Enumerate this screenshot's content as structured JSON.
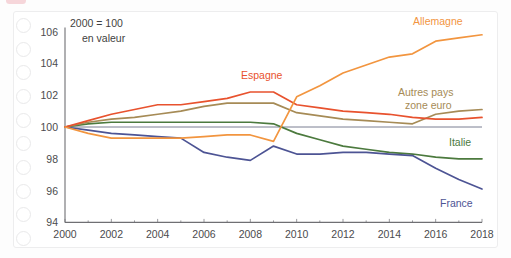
{
  "card": {
    "background_color": "#ffffff",
    "border_color": "#ededee"
  },
  "binding": {
    "name": "notebook-binding-holes",
    "count": 10,
    "color": "#e9e9ea"
  },
  "annotation": {
    "line1": "2000 = 100",
    "line2": "en valeur"
  },
  "axis": {
    "y_ticks": [
      "94",
      "96",
      "98",
      "100",
      "102",
      "104",
      "106"
    ],
    "x_ticks": [
      "2000",
      "2002",
      "2004",
      "2006",
      "2008",
      "2010",
      "2012",
      "2014",
      "2016",
      "2018"
    ],
    "tick_color": "#4b4b4d"
  },
  "labels": {
    "allemagne": "Allemagne",
    "espagne": "Espagne",
    "autres_pays_l1": "Autres pays",
    "autres_pays_l2": "zone euro",
    "italie": "Italie",
    "france": "France"
  },
  "chart_data": {
    "type": "line",
    "title": "",
    "subtitle": "",
    "annotation": "2000 = 100 en valeur",
    "xlabel": "",
    "ylabel": "",
    "xlim": [
      2000,
      2018
    ],
    "ylim": [
      94,
      106
    ],
    "grid": false,
    "legend_position": "inline-right",
    "x": [
      2000,
      2001,
      2002,
      2003,
      2004,
      2005,
      2006,
      2007,
      2008,
      2009,
      2010,
      2011,
      2012,
      2013,
      2014,
      2015,
      2016,
      2017,
      2018
    ],
    "series": [
      {
        "name": "Allemagne",
        "color": "#f59game",
        "values": [
          100.0,
          99.6,
          99.3,
          99.3,
          99.3,
          99.3,
          99.4,
          99.5,
          99.5,
          99.1,
          101.9,
          102.6,
          103.4,
          103.9,
          104.4,
          104.6,
          105.4,
          105.6,
          105.8
        ]
      },
      {
        "name": "Espagne",
        "color": "#e8522e",
        "values": [
          100.0,
          100.4,
          100.8,
          101.1,
          101.4,
          101.4,
          101.6,
          101.8,
          102.2,
          102.2,
          101.4,
          101.2,
          101.0,
          100.9,
          100.8,
          100.6,
          100.5,
          100.5,
          100.6
        ]
      },
      {
        "name": "Autres pays zone euro",
        "color": "#a68b56"
      },
      {
        "name": "Italie",
        "color": "#4c7a3e"
      },
      {
        "name": "France",
        "color": "#4d5494"
      }
    ],
    "series_values": {
      "Allemagne": [
        100.0,
        99.6,
        99.3,
        99.3,
        99.3,
        99.3,
        99.4,
        99.5,
        99.5,
        99.1,
        101.9,
        102.6,
        103.4,
        103.9,
        104.4,
        104.6,
        105.4,
        105.6,
        105.8
      ],
      "Espagne": [
        100.0,
        100.4,
        100.8,
        101.1,
        101.4,
        101.4,
        101.6,
        101.8,
        102.2,
        102.2,
        101.4,
        101.2,
        101.0,
        100.9,
        100.8,
        100.6,
        100.5,
        100.5,
        100.6
      ],
      "Autres pays zone euro": [
        100.0,
        100.3,
        100.5,
        100.6,
        100.8,
        101.0,
        101.3,
        101.5,
        101.5,
        101.5,
        100.9,
        100.7,
        100.5,
        100.4,
        100.3,
        100.2,
        100.8,
        101.0,
        101.1
      ],
      "Italie": [
        100.0,
        100.2,
        100.3,
        100.3,
        100.3,
        100.3,
        100.3,
        100.3,
        100.3,
        100.2,
        99.6,
        99.2,
        98.8,
        98.6,
        98.4,
        98.3,
        98.1,
        98.0,
        98.0
      ],
      "France": [
        100.0,
        99.8,
        99.6,
        99.5,
        99.4,
        99.3,
        98.4,
        98.1,
        97.9,
        98.8,
        98.3,
        98.3,
        98.4,
        98.4,
        98.3,
        98.2,
        97.4,
        96.7,
        96.1
      ]
    },
    "colors": {
      "Allemagne": "#f2953f",
      "Espagne": "#e8522e",
      "Autres pays zone euro": "#a68b56",
      "Italie": "#4c7a3e",
      "France": "#4d5494"
    }
  }
}
